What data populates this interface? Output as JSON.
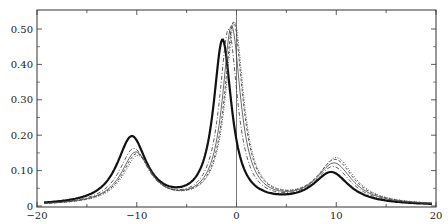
{
  "chart_data": {
    "type": "line",
    "title": "",
    "xlabel": "",
    "ylabel": "",
    "xlim": [
      -20,
      20
    ],
    "ylim": [
      0,
      0.55
    ],
    "grid": false,
    "legend": null,
    "x_ticks": [
      -20,
      -10,
      0,
      10,
      20
    ],
    "x_tick_labels": [
      "−20",
      "−10",
      "0",
      "10",
      "20"
    ],
    "y_ticks": [
      0,
      0.1,
      0.2,
      0.3,
      0.4,
      0.5
    ],
    "y_tick_labels": [
      "0",
      "0.10",
      "0.20",
      "0.30",
      "0.40",
      "0.50"
    ],
    "vertical_reference_line_x": 0,
    "series": [
      {
        "name": "curve-1 (thick solid)",
        "style": "thick-solid",
        "peaks": [
          {
            "x": -10.5,
            "y": 0.19
          },
          {
            "x": -1.4,
            "y": 0.46
          },
          {
            "x": 9.5,
            "y": 0.09
          }
        ],
        "widths": [
          1.8,
          1.1,
          2.2
        ]
      },
      {
        "name": "curve-2 (thin dash-dot)",
        "style": "dashdot",
        "peaks": [
          {
            "x": -10.3,
            "y": 0.155
          },
          {
            "x": -0.8,
            "y": 0.49
          },
          {
            "x": 9.7,
            "y": 0.105
          }
        ],
        "widths": [
          1.8,
          1.1,
          2.2
        ]
      },
      {
        "name": "curve-3 (thin solid)",
        "style": "thin-solid",
        "peaks": [
          {
            "x": -10.1,
            "y": 0.145
          },
          {
            "x": -0.5,
            "y": 0.5
          },
          {
            "x": 9.8,
            "y": 0.115
          }
        ],
        "widths": [
          1.8,
          1.1,
          2.2
        ]
      },
      {
        "name": "curve-4 (dashed)",
        "style": "dashed",
        "peaks": [
          {
            "x": -10.0,
            "y": 0.14
          },
          {
            "x": -0.3,
            "y": 0.51
          },
          {
            "x": 9.9,
            "y": 0.125
          }
        ],
        "widths": [
          1.8,
          1.1,
          2.2
        ]
      },
      {
        "name": "curve-5 (dotted)",
        "style": "dotted",
        "peaks": [
          {
            "x": -9.9,
            "y": 0.135
          },
          {
            "x": -0.2,
            "y": 0.51
          },
          {
            "x": 10.0,
            "y": 0.13
          }
        ],
        "widths": [
          1.8,
          1.1,
          2.2
        ]
      }
    ]
  }
}
